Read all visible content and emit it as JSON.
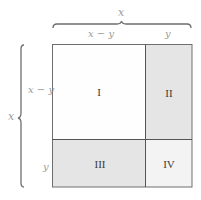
{
  "diagram": {
    "type": "area-decomposition-square",
    "top_total_label": "x",
    "left_total_label": "x",
    "column_labels": [
      "x − y",
      "y"
    ],
    "row_labels": [
      "x − y",
      "y"
    ],
    "regions": [
      {
        "id": "I",
        "label": "I",
        "fill": "#fefefe"
      },
      {
        "id": "II",
        "label": "II",
        "fill": "#e5e5e5"
      },
      {
        "id": "III",
        "label": "III",
        "fill": "#e5e5e5"
      },
      {
        "id": "IV",
        "label": "IV",
        "fill": "#f3f3f3"
      }
    ],
    "colors": {
      "stroke": "#6e6e6e",
      "label_text": "#9a9a9a",
      "roman_text": "#3a3a3a"
    }
  }
}
